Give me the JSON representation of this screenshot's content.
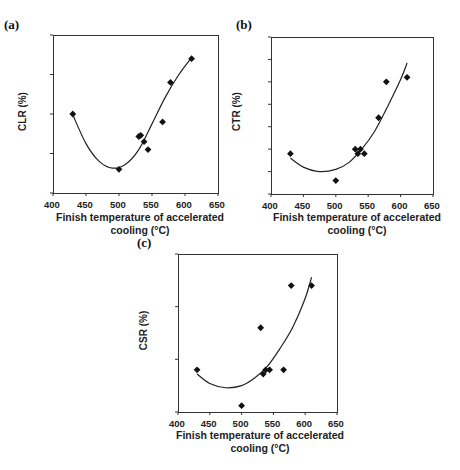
{
  "chart_data": [
    {
      "panel": "(a)",
      "type": "scatter",
      "xlabel": "Finish temperature of accelerated cooling (°C)",
      "ylabel": "CLR (%)",
      "xlim": [
        400,
        650
      ],
      "ylim": [
        0,
        40
      ],
      "xticks": [
        400,
        450,
        500,
        550,
        600,
        650
      ],
      "yticks": [
        0,
        10,
        20,
        30,
        40
      ],
      "ytick_labels": [
        "0",
        "10",
        "20",
        "30",
        "40"
      ],
      "grid": false,
      "x": [
        430,
        500,
        530,
        533,
        538,
        544,
        566,
        578,
        610
      ],
      "y": [
        20,
        6,
        14.3,
        14.6,
        13,
        11,
        18,
        28,
        34
      ],
      "trendline": {
        "type": "polynomial-2",
        "from": 430,
        "to": 610,
        "points": [
          [
            430,
            19.8
          ],
          [
            450,
            12.5
          ],
          [
            470,
            8.0
          ],
          [
            490,
            6.3
          ],
          [
            510,
            7.3
          ],
          [
            530,
            11.0
          ],
          [
            550,
            17.5
          ],
          [
            570,
            24.2
          ],
          [
            590,
            29.8
          ],
          [
            610,
            34.3
          ]
        ]
      }
    },
    {
      "panel": "(b)",
      "type": "scatter",
      "xlabel": "Finish temperature of accelerated cooling (°C)",
      "ylabel": "CTR (%)",
      "xlim": [
        400,
        650
      ],
      "ylim": [
        0,
        3.5
      ],
      "xticks": [
        400,
        450,
        500,
        550,
        600,
        650
      ],
      "yticks": [
        0,
        0.5,
        1.0,
        1.5,
        2.0,
        2.5,
        3.0,
        3.5
      ],
      "ytick_labels": [
        "0",
        "0.5",
        "1.0",
        "1.5",
        "2.0",
        "2.5",
        "3.0",
        "3.5"
      ],
      "grid": false,
      "x": [
        430,
        500,
        530,
        534,
        538,
        544,
        566,
        578,
        610
      ],
      "y": [
        0.9,
        0.3,
        1.0,
        0.9,
        1.0,
        0.9,
        1.7,
        2.5,
        2.6
      ],
      "trendline": {
        "type": "polynomial-2",
        "from": 430,
        "to": 610,
        "points": [
          [
            430,
            0.8
          ],
          [
            450,
            0.6
          ],
          [
            475,
            0.5
          ],
          [
            500,
            0.55
          ],
          [
            520,
            0.7
          ],
          [
            540,
            1.0
          ],
          [
            560,
            1.4
          ],
          [
            580,
            1.95
          ],
          [
            600,
            2.55
          ],
          [
            610,
            2.92
          ]
        ]
      }
    },
    {
      "panel": "(c)",
      "type": "scatter",
      "xlabel": "Finish temperature of accelerated cooling (°C)",
      "ylabel": "CSR (%)",
      "xlim": [
        400,
        650
      ],
      "ylim": [
        0,
        0.75
      ],
      "xticks": [
        400,
        450,
        500,
        550,
        600,
        650
      ],
      "yticks": [
        0,
        0.25,
        0.5,
        0.75
      ],
      "ytick_labels": [
        "0",
        "0.25",
        "0.50",
        "0.75"
      ],
      "grid": false,
      "x": [
        430,
        500,
        530,
        534,
        538,
        544,
        566,
        578,
        610
      ],
      "y": [
        0.2,
        0.03,
        0.4,
        0.18,
        0.2,
        0.2,
        0.2,
        0.6,
        0.6
      ],
      "trendline": {
        "type": "polynomial-2",
        "from": 430,
        "to": 610,
        "points": [
          [
            430,
            0.18
          ],
          [
            450,
            0.135
          ],
          [
            475,
            0.115
          ],
          [
            500,
            0.125
          ],
          [
            520,
            0.16
          ],
          [
            540,
            0.215
          ],
          [
            560,
            0.3
          ],
          [
            580,
            0.4
          ],
          [
            600,
            0.54
          ],
          [
            610,
            0.64
          ]
        ]
      }
    }
  ],
  "panels": {
    "a": {
      "label": "(a)",
      "ylabel": "CLR (%)",
      "xlabel_line1": "Finish temperature of accelerated",
      "xlabel_line2": "cooling (°C)"
    },
    "b": {
      "label": "(b)",
      "ylabel": "CTR (%)",
      "xlabel_line1": "Finish temperature of accelerated",
      "xlabel_line2": "cooling (°C)"
    },
    "c": {
      "label": "(c)",
      "ylabel": "CSR (%)",
      "xlabel_line1": "Finish temperature of accelerated",
      "xlabel_line2": "cooling (°C)"
    }
  },
  "colors": {
    "marker": "#111111",
    "line": "#222222",
    "axis": "#333333"
  }
}
